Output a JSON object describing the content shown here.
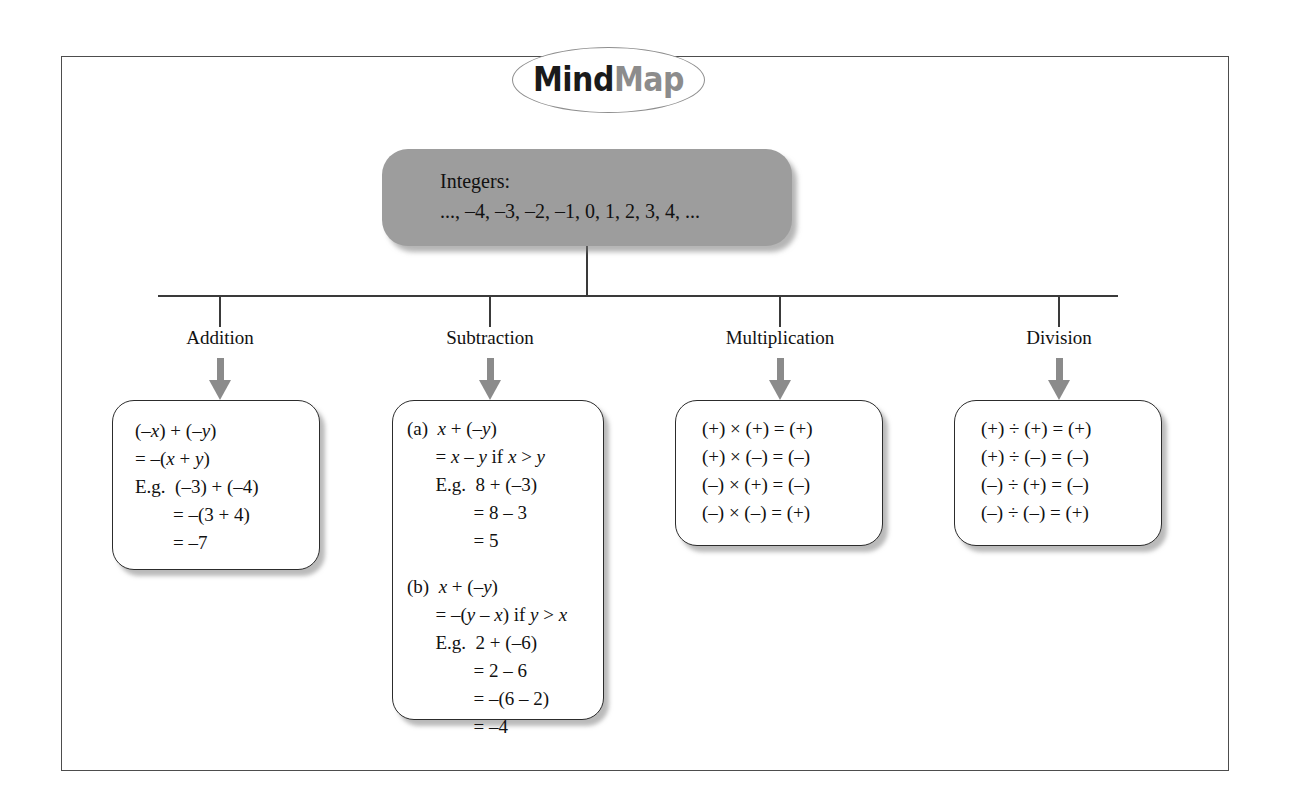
{
  "logo": {
    "part_dark": "Mind",
    "part_light": "Map",
    "icon": "mindmap-ellipse-logo"
  },
  "root": {
    "title": "Integers:",
    "sequence": "..., –4, –3, –2, –1, 0, 1, 2, 3, 4, ...",
    "fill_color": "#9d9d9d"
  },
  "branches": [
    {
      "key": "addition",
      "label": "Addition"
    },
    {
      "key": "subtraction",
      "label": "Subtraction"
    },
    {
      "key": "multiplication",
      "label": "Multiplication"
    },
    {
      "key": "division",
      "label": "Division"
    }
  ],
  "boxes": {
    "addition": {
      "lines": [
        "(–x) + (–y)",
        "= –(x + y)",
        "E.g.  (–3) + (–4)",
        "        = –(3 + 4)",
        "        = –7"
      ]
    },
    "subtraction": {
      "part_a": [
        "(a)  x + (–y)",
        "      = x – y if x > y",
        "      E.g.  8 + (–3)",
        "              = 8 – 3",
        "              = 5"
      ],
      "part_b": [
        "(b)  x + (–y)",
        "      = –(y – x) if y > x",
        "      E.g.  2 + (–6)",
        "              = 2 – 6",
        "              = –(6 – 2)",
        "              = –4"
      ]
    },
    "multiplication": {
      "lines": [
        "(+) × (+) = (+)",
        "(+) × (–) = (–)",
        "(–) × (+) = (–)",
        "(–) × (–) = (+)"
      ]
    },
    "division": {
      "lines": [
        "(+) ÷ (+) = (+)",
        "(+) ÷ (–) = (–)",
        "(–) ÷ (+) = (–)",
        "(–) ÷ (–) = (+)"
      ]
    }
  },
  "colors": {
    "frame_border": "#4d4d4d",
    "arrow": "#8b8b8b",
    "box_border": "#2c2c2c",
    "line": "#3a3a3a"
  }
}
